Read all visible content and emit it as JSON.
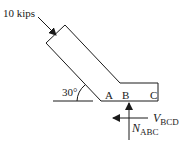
{
  "diagram": {
    "load_label": "10 kips",
    "angle_label": "30°",
    "points": {
      "a": "A",
      "b": "B",
      "c": "C"
    },
    "shear": {
      "symbol": "V",
      "subscript": "BCD"
    },
    "normal": {
      "symbol": "N",
      "subscript": "ABC"
    },
    "colors": {
      "stroke": "#1a1a1a",
      "background": "#ffffff"
    }
  }
}
